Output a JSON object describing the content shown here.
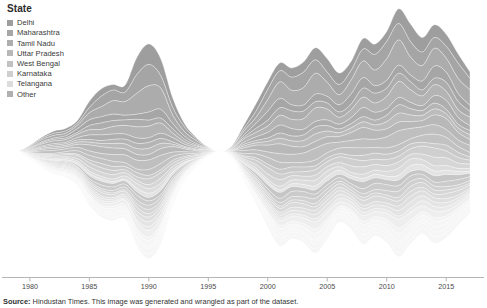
{
  "legend": {
    "title": "State",
    "items": [
      {
        "label": "Delhi",
        "color": "#9e9e9e"
      },
      {
        "label": "Maharashtra",
        "color": "#a6a6a6"
      },
      {
        "label": "Tamil Nadu",
        "color": "#aeaeae"
      },
      {
        "label": "Uttar Pradesh",
        "color": "#b8b8b8"
      },
      {
        "label": "West Bengal",
        "color": "#c2c2c2"
      },
      {
        "label": "Karnataka",
        "color": "#cfcfcf"
      },
      {
        "label": "Telangana",
        "color": "#dcdcdc"
      },
      {
        "label": "Other",
        "color": "#b0b0b0"
      }
    ]
  },
  "axis": {
    "ticks": [
      "1980",
      "1985",
      "1990",
      "1995",
      "2000",
      "2005",
      "2010",
      "2015"
    ]
  },
  "caption": {
    "source_label": "Source:",
    "source_text": " Hindustan Times. This image was generated and wrangled as part of the dataset."
  },
  "chart_data": {
    "type": "area",
    "title": "State",
    "xlabel": "",
    "ylabel": "",
    "xlim": [
      1979,
      2017
    ],
    "grid": false,
    "legend_position": "top-left",
    "stacking": "streamgraph-wiggle",
    "x": [
      1979,
      1980,
      1981,
      1982,
      1983,
      1984,
      1985,
      1986,
      1987,
      1988,
      1989,
      1990,
      1991,
      1992,
      1993,
      1994,
      1995,
      1996,
      1997,
      1998,
      1999,
      2000,
      2001,
      2002,
      2003,
      2004,
      2005,
      2006,
      2007,
      2008,
      2009,
      2010,
      2011,
      2012,
      2013,
      2014,
      2015,
      2016,
      2017
    ],
    "series": [
      {
        "name": "Delhi",
        "color": "#9e9e9e",
        "values": [
          0,
          2,
          4,
          6,
          7,
          9,
          22,
          30,
          28,
          26,
          48,
          62,
          54,
          30,
          14,
          6,
          1,
          0,
          2,
          10,
          22,
          34,
          38,
          34,
          36,
          40,
          36,
          34,
          38,
          44,
          40,
          42,
          48,
          46,
          44,
          48,
          44,
          40,
          30
        ]
      },
      {
        "name": "Maharashtra",
        "color": "#a6a6a6",
        "values": [
          0,
          2,
          4,
          6,
          8,
          10,
          16,
          20,
          20,
          18,
          26,
          30,
          26,
          16,
          9,
          4,
          1,
          0,
          2,
          8,
          16,
          24,
          26,
          24,
          26,
          28,
          26,
          24,
          26,
          30,
          28,
          29,
          32,
          31,
          30,
          32,
          30,
          26,
          20
        ]
      },
      {
        "name": "Tamil Nadu",
        "color": "#aeaeae",
        "values": [
          0,
          2,
          3,
          5,
          6,
          8,
          11,
          14,
          14,
          13,
          17,
          20,
          17,
          11,
          6,
          3,
          1,
          0,
          1,
          6,
          11,
          16,
          18,
          17,
          18,
          19,
          18,
          17,
          18,
          20,
          19,
          20,
          22,
          21,
          20,
          22,
          20,
          17,
          13
        ]
      },
      {
        "name": "Uttar Pradesh",
        "color": "#b8b8b8",
        "values": [
          0,
          1,
          3,
          4,
          5,
          6,
          9,
          11,
          11,
          10,
          13,
          15,
          13,
          9,
          5,
          2,
          1,
          0,
          1,
          5,
          9,
          12,
          14,
          13,
          14,
          15,
          14,
          13,
          14,
          16,
          15,
          16,
          17,
          16,
          16,
          17,
          16,
          13,
          10
        ]
      },
      {
        "name": "West Bengal",
        "color": "#c2c2c2",
        "values": [
          0,
          1,
          2,
          3,
          4,
          5,
          7,
          9,
          9,
          8,
          10,
          12,
          10,
          7,
          4,
          2,
          1,
          0,
          1,
          4,
          7,
          10,
          11,
          10,
          11,
          12,
          11,
          10,
          11,
          12,
          12,
          13,
          14,
          13,
          13,
          14,
          13,
          11,
          8
        ]
      },
      {
        "name": "Karnataka",
        "color": "#cfcfcf",
        "values": [
          0,
          1,
          2,
          3,
          3,
          4,
          6,
          7,
          7,
          6,
          8,
          9,
          8,
          5,
          3,
          2,
          1,
          0,
          1,
          3,
          6,
          8,
          9,
          8,
          9,
          10,
          9,
          8,
          9,
          10,
          10,
          11,
          12,
          11,
          11,
          12,
          11,
          9,
          7
        ]
      },
      {
        "name": "Telangana",
        "color": "#dcdcdc",
        "values": [
          0,
          1,
          2,
          2,
          3,
          4,
          5,
          6,
          6,
          5,
          7,
          8,
          7,
          5,
          3,
          1,
          1,
          0,
          1,
          3,
          5,
          7,
          8,
          7,
          8,
          9,
          8,
          7,
          8,
          9,
          9,
          10,
          11,
          10,
          10,
          11,
          10,
          8,
          6
        ]
      },
      {
        "name": "Other",
        "color": "#b0b0b0",
        "values": [
          0,
          4,
          9,
          14,
          18,
          24,
          34,
          44,
          44,
          40,
          58,
          70,
          60,
          36,
          20,
          9,
          2,
          0,
          4,
          18,
          36,
          54,
          62,
          58,
          62,
          68,
          62,
          58,
          62,
          72,
          68,
          72,
          80,
          78,
          76,
          80,
          74,
          62,
          46
        ]
      }
    ]
  }
}
